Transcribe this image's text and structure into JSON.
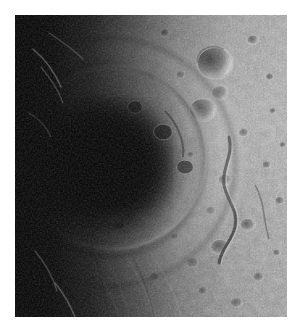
{
  "view": {
    "background_color": "#ffffff",
    "width": 301,
    "height": 334
  },
  "image": {
    "name": "planetary-surface-photograph",
    "alt_text": "Grayscale spacecraft image of a large multi-ring impact basin on an airless cratered body, lit from the right with the left side in deep terminator shadow",
    "subject": "multi-ring impact basin",
    "palette": "grayscale",
    "frame": {
      "x": 15,
      "y": 15,
      "width": 272,
      "height": 302
    },
    "colors": {
      "shadow": "#040404",
      "dark_floor": "#1a1a1a",
      "midtone": "#7e7e7e",
      "highlight": "#dcdcdc",
      "brightest": "#f2f2f2",
      "background": "#ffffff"
    },
    "lighting": {
      "sun_direction": "from right",
      "terminator_side": "left"
    },
    "features": [
      {
        "name": "basin-floor-shadowed",
        "cx": 0.33,
        "cy": 0.5,
        "r": 0.27,
        "tone": "very-dark"
      },
      {
        "name": "basin-inner-ring",
        "cx": 0.36,
        "cy": 0.47,
        "r": 0.34,
        "tone": "bright-arc"
      },
      {
        "name": "basin-outer-ring",
        "cx": 0.36,
        "cy": 0.48,
        "r": 0.46,
        "tone": "ridged"
      },
      {
        "name": "terminator-shadow-left",
        "cx": 0.04,
        "cy": 0.5,
        "tone": "black"
      },
      {
        "name": "cratered-highlands-right",
        "cx": 0.78,
        "cy": 0.42,
        "tone": "bright"
      },
      {
        "name": "sinuous-scarp",
        "cx": 0.76,
        "cy": 0.58,
        "tone": "dark-lineament"
      },
      {
        "name": "radial-ejecta-ridges",
        "cx": 0.42,
        "cy": 0.84,
        "tone": "streaked"
      }
    ],
    "caption": ""
  }
}
